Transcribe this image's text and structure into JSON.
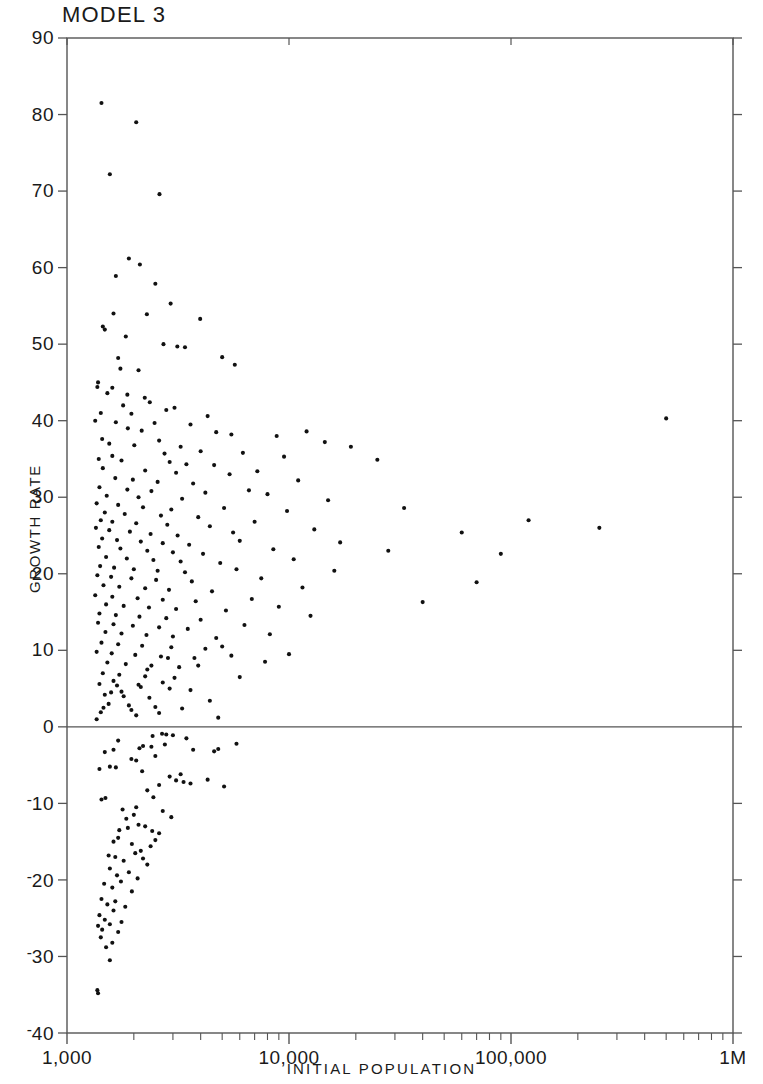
{
  "chart_data": {
    "type": "scatter",
    "title": "MODEL 3",
    "xlabel": "INITIAL POPULATION",
    "ylabel": "GROWTH RATE",
    "xscale": "log",
    "yscale": "linear",
    "xlim": [
      1000,
      1000000
    ],
    "ylim": [
      -40,
      90
    ],
    "grid": false,
    "legend": null,
    "marker": "dot",
    "marker_color": "#111111",
    "marker_size": 3,
    "frame_color": "#555555",
    "zero_line": 0,
    "xtick_labels": [
      "1,000",
      "10,000",
      "100,000",
      "1M"
    ],
    "xtick_values": [
      1000,
      10000,
      100000,
      1000000
    ],
    "xminor_multipliers": [
      2,
      3,
      4,
      5,
      6,
      7,
      8,
      9
    ],
    "ytick_labels": [
      "90",
      "80",
      "70",
      "60",
      "50",
      "40",
      "30",
      "20",
      "10",
      "0",
      "-10",
      "-20",
      "-30",
      "-40"
    ],
    "ytick_values": [
      90,
      80,
      70,
      60,
      50,
      40,
      30,
      20,
      10,
      0,
      -10,
      -20,
      -30,
      -40
    ],
    "points": [
      [
        1430,
        81.5
      ],
      [
        2050,
        79.0
      ],
      [
        1560,
        72.2
      ],
      [
        2610,
        69.6
      ],
      [
        1900,
        61.2
      ],
      [
        2130,
        60.4
      ],
      [
        1660,
        58.9
      ],
      [
        2500,
        57.9
      ],
      [
        2930,
        55.3
      ],
      [
        1620,
        54.0
      ],
      [
        2290,
        53.9
      ],
      [
        3980,
        53.3
      ],
      [
        1450,
        52.3
      ],
      [
        1480,
        51.9
      ],
      [
        1840,
        51.0
      ],
      [
        2720,
        50.0
      ],
      [
        3140,
        49.7
      ],
      [
        3400,
        49.6
      ],
      [
        1700,
        48.2
      ],
      [
        5000,
        48.3
      ],
      [
        5700,
        47.3
      ],
      [
        1740,
        46.8
      ],
      [
        2100,
        46.6
      ],
      [
        1380,
        45.0
      ],
      [
        1370,
        44.4
      ],
      [
        1600,
        44.3
      ],
      [
        1520,
        43.6
      ],
      [
        1870,
        43.4
      ],
      [
        2240,
        43.0
      ],
      [
        2360,
        42.4
      ],
      [
        1790,
        42.0
      ],
      [
        3050,
        41.7
      ],
      [
        2800,
        41.4
      ],
      [
        1420,
        41.0
      ],
      [
        1950,
        40.9
      ],
      [
        4300,
        40.6
      ],
      [
        500000,
        40.3
      ],
      [
        1340,
        40.0
      ],
      [
        1660,
        39.8
      ],
      [
        2480,
        39.7
      ],
      [
        3600,
        39.5
      ],
      [
        1880,
        39.0
      ],
      [
        2170,
        38.7
      ],
      [
        4700,
        38.5
      ],
      [
        5500,
        38.2
      ],
      [
        1440,
        37.6
      ],
      [
        2600,
        37.4
      ],
      [
        12000,
        38.6
      ],
      [
        8800,
        38.0
      ],
      [
        1550,
        37.0
      ],
      [
        2010,
        36.8
      ],
      [
        3250,
        36.6
      ],
      [
        14500,
        37.2
      ],
      [
        19000,
        36.6
      ],
      [
        4000,
        36.0
      ],
      [
        2750,
        35.7
      ],
      [
        1600,
        35.4
      ],
      [
        6200,
        35.8
      ],
      [
        9500,
        35.3
      ],
      [
        1390,
        35.0
      ],
      [
        1760,
        34.8
      ],
      [
        2900,
        34.6
      ],
      [
        3450,
        34.3
      ],
      [
        4600,
        34.2
      ],
      [
        25000,
        34.9
      ],
      [
        1450,
        33.8
      ],
      [
        2250,
        33.5
      ],
      [
        3100,
        33.2
      ],
      [
        5400,
        33.0
      ],
      [
        7200,
        33.4
      ],
      [
        1650,
        32.5
      ],
      [
        1980,
        32.3
      ],
      [
        2560,
        32.0
      ],
      [
        3700,
        31.8
      ],
      [
        11000,
        32.2
      ],
      [
        1400,
        31.3
      ],
      [
        1870,
        31.0
      ],
      [
        2400,
        30.8
      ],
      [
        4200,
        30.6
      ],
      [
        6600,
        30.9
      ],
      [
        1510,
        30.2
      ],
      [
        2100,
        30.0
      ],
      [
        3300,
        29.8
      ],
      [
        8000,
        30.4
      ],
      [
        15000,
        29.6
      ],
      [
        1360,
        29.2
      ],
      [
        1700,
        29.0
      ],
      [
        2200,
        28.7
      ],
      [
        2950,
        28.4
      ],
      [
        5100,
        28.6
      ],
      [
        1480,
        28.0
      ],
      [
        1820,
        27.8
      ],
      [
        2650,
        27.6
      ],
      [
        3900,
        27.4
      ],
      [
        9800,
        28.2
      ],
      [
        33000,
        28.6
      ],
      [
        1420,
        27.0
      ],
      [
        1600,
        26.8
      ],
      [
        2050,
        26.6
      ],
      [
        2830,
        26.4
      ],
      [
        4400,
        26.2
      ],
      [
        7000,
        26.8
      ],
      [
        250000,
        26.0
      ],
      [
        1350,
        26.0
      ],
      [
        1550,
        25.7
      ],
      [
        1920,
        25.5
      ],
      [
        2380,
        25.2
      ],
      [
        3150,
        25.0
      ],
      [
        5600,
        25.4
      ],
      [
        13000,
        25.8
      ],
      [
        60000,
        25.4
      ],
      [
        120000,
        27.0
      ],
      [
        1440,
        24.6
      ],
      [
        1680,
        24.4
      ],
      [
        2150,
        24.2
      ],
      [
        2700,
        24.0
      ],
      [
        3550,
        23.8
      ],
      [
        6000,
        24.3
      ],
      [
        17000,
        24.1
      ],
      [
        1390,
        23.5
      ],
      [
        1740,
        23.3
      ],
      [
        2300,
        23.0
      ],
      [
        3000,
        22.8
      ],
      [
        4100,
        22.6
      ],
      [
        8500,
        23.2
      ],
      [
        28000,
        23.0
      ],
      [
        1500,
        22.2
      ],
      [
        1860,
        22.0
      ],
      [
        2450,
        21.8
      ],
      [
        3250,
        21.6
      ],
      [
        4900,
        21.4
      ],
      [
        10500,
        21.9
      ],
      [
        90000,
        22.6
      ],
      [
        1410,
        21.0
      ],
      [
        1630,
        20.8
      ],
      [
        2000,
        20.6
      ],
      [
        2560,
        20.4
      ],
      [
        3400,
        20.2
      ],
      [
        5800,
        20.6
      ],
      [
        16000,
        20.4
      ],
      [
        1370,
        19.8
      ],
      [
        1580,
        19.6
      ],
      [
        1950,
        19.4
      ],
      [
        2520,
        19.2
      ],
      [
        3650,
        19.0
      ],
      [
        7500,
        19.4
      ],
      [
        70000,
        18.9
      ],
      [
        1460,
        18.5
      ],
      [
        1720,
        18.3
      ],
      [
        2250,
        18.1
      ],
      [
        2880,
        17.9
      ],
      [
        4500,
        17.7
      ],
      [
        11500,
        18.2
      ],
      [
        1340,
        17.2
      ],
      [
        1600,
        17.0
      ],
      [
        2080,
        16.8
      ],
      [
        2700,
        16.6
      ],
      [
        3800,
        16.4
      ],
      [
        6800,
        16.7
      ],
      [
        40000,
        16.3
      ],
      [
        1500,
        16.0
      ],
      [
        1800,
        15.8
      ],
      [
        2340,
        15.6
      ],
      [
        3100,
        15.4
      ],
      [
        5200,
        15.2
      ],
      [
        9000,
        15.7
      ],
      [
        1400,
        14.8
      ],
      [
        1660,
        14.6
      ],
      [
        2120,
        14.4
      ],
      [
        2800,
        14.2
      ],
      [
        4000,
        14.0
      ],
      [
        12500,
        14.5
      ],
      [
        1380,
        13.6
      ],
      [
        1620,
        13.4
      ],
      [
        1980,
        13.2
      ],
      [
        2600,
        13.0
      ],
      [
        3500,
        12.8
      ],
      [
        6300,
        13.3
      ],
      [
        1490,
        12.4
      ],
      [
        1760,
        12.2
      ],
      [
        2280,
        12.0
      ],
      [
        3000,
        11.8
      ],
      [
        4700,
        11.6
      ],
      [
        8200,
        12.1
      ],
      [
        1430,
        11.0
      ],
      [
        1700,
        10.8
      ],
      [
        2180,
        10.6
      ],
      [
        2950,
        10.4
      ],
      [
        4200,
        10.2
      ],
      [
        1360,
        9.8
      ],
      [
        1590,
        9.6
      ],
      [
        2030,
        9.4
      ],
      [
        2650,
        9.2
      ],
      [
        3750,
        9.0
      ],
      [
        5500,
        9.3
      ],
      [
        10000,
        9.5
      ],
      [
        1520,
        8.4
      ],
      [
        1840,
        8.2
      ],
      [
        2400,
        8.0
      ],
      [
        3200,
        7.8
      ],
      [
        1450,
        7.0
      ],
      [
        1720,
        6.8
      ],
      [
        2250,
        6.6
      ],
      [
        3050,
        6.4
      ],
      [
        1400,
        5.6
      ],
      [
        1680,
        5.4
      ],
      [
        2150,
        5.2
      ],
      [
        2900,
        5.0
      ],
      [
        1480,
        4.2
      ],
      [
        1800,
        4.0
      ],
      [
        2350,
        3.8
      ],
      [
        4400,
        3.4
      ],
      [
        1540,
        3.0
      ],
      [
        1900,
        2.8
      ],
      [
        2500,
        2.6
      ],
      [
        1420,
        1.9
      ],
      [
        1760,
        4.6
      ],
      [
        2050,
        1.5
      ],
      [
        3300,
        2.4
      ],
      [
        2700,
        5.8
      ],
      [
        4800,
        1.2
      ],
      [
        1360,
        1.0
      ],
      [
        6000,
        6.5
      ],
      [
        2850,
        9.0
      ],
      [
        7800,
        8.5
      ],
      [
        1620,
        6.0
      ],
      [
        1950,
        2.2
      ],
      [
        2300,
        7.5
      ],
      [
        3600,
        4.8
      ],
      [
        5000,
        10.5
      ],
      [
        1580,
        4.5
      ],
      [
        2600,
        1.8
      ],
      [
        3900,
        8.0
      ],
      [
        1460,
        2.5
      ],
      [
        2100,
        5.5
      ],
      [
        2430,
        -1.2
      ],
      [
        2800,
        -1.0
      ],
      [
        2680,
        -0.9
      ],
      [
        3000,
        -1.1
      ],
      [
        1700,
        -1.8
      ],
      [
        5800,
        -2.2
      ],
      [
        3450,
        -1.5
      ],
      [
        2200,
        -2.5
      ],
      [
        2400,
        -2.6
      ],
      [
        1480,
        -3.3
      ],
      [
        1620,
        -3.0
      ],
      [
        2120,
        -2.8
      ],
      [
        2760,
        -2.3
      ],
      [
        4600,
        -3.2
      ],
      [
        4800,
        -2.9
      ],
      [
        3700,
        -3.0
      ],
      [
        2500,
        -3.8
      ],
      [
        1950,
        -4.2
      ],
      [
        2050,
        -4.4
      ],
      [
        1400,
        -5.5
      ],
      [
        1560,
        -5.2
      ],
      [
        1660,
        -5.3
      ],
      [
        2180,
        -5.8
      ],
      [
        1430,
        -9.5
      ],
      [
        1490,
        -9.3
      ],
      [
        2600,
        -7.6
      ],
      [
        3100,
        -7.0
      ],
      [
        3350,
        -7.2
      ],
      [
        3600,
        -7.4
      ],
      [
        4300,
        -6.9
      ],
      [
        5100,
        -7.8
      ],
      [
        2300,
        -8.3
      ],
      [
        2450,
        -9.2
      ],
      [
        2000,
        -11.5
      ],
      [
        2100,
        -12.8
      ],
      [
        2700,
        -11.0
      ],
      [
        2950,
        -11.8
      ],
      [
        1850,
        -12.0
      ],
      [
        1720,
        -13.5
      ],
      [
        1880,
        -13.2
      ],
      [
        2250,
        -13.0
      ],
      [
        2420,
        -13.6
      ],
      [
        2500,
        -14.8
      ],
      [
        2600,
        -13.9
      ],
      [
        1620,
        -15.0
      ],
      [
        1700,
        -14.5
      ],
      [
        1960,
        -15.3
      ],
      [
        2150,
        -16.2
      ],
      [
        2380,
        -15.6
      ],
      [
        1540,
        -16.8
      ],
      [
        1650,
        -17.0
      ],
      [
        1800,
        -17.5
      ],
      [
        2030,
        -16.5
      ],
      [
        2200,
        -17.2
      ],
      [
        2300,
        -18.0
      ],
      [
        1560,
        -18.5
      ],
      [
        1680,
        -19.4
      ],
      [
        1900,
        -19.0
      ],
      [
        2080,
        -19.8
      ],
      [
        1470,
        -20.5
      ],
      [
        1600,
        -21.0
      ],
      [
        1750,
        -20.2
      ],
      [
        1960,
        -21.5
      ],
      [
        1430,
        -22.5
      ],
      [
        1520,
        -23.2
      ],
      [
        1650,
        -22.8
      ],
      [
        1830,
        -23.5
      ],
      [
        1400,
        -24.6
      ],
      [
        1480,
        -25.2
      ],
      [
        1620,
        -24.0
      ],
      [
        1760,
        -25.5
      ],
      [
        1380,
        -26.0
      ],
      [
        1440,
        -26.5
      ],
      [
        1560,
        -25.8
      ],
      [
        1700,
        -26.8
      ],
      [
        1420,
        -27.5
      ],
      [
        1600,
        -28.2
      ],
      [
        1500,
        -28.8
      ],
      [
        1560,
        -30.5
      ],
      [
        1370,
        -34.4
      ],
      [
        1380,
        -34.8
      ],
      [
        2900,
        -6.5
      ],
      [
        3250,
        -6.2
      ],
      [
        2050,
        -10.5
      ],
      [
        1780,
        -10.8
      ]
    ]
  }
}
